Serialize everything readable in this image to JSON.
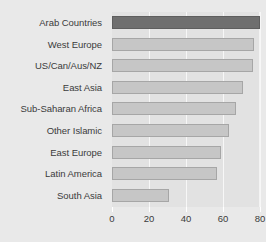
{
  "chart_data": {
    "type": "bar",
    "orientation": "horizontal",
    "title": "",
    "xlabel": "",
    "ylabel": "",
    "xlim": [
      0,
      80
    ],
    "xticks": [
      0,
      20,
      40,
      60,
      80
    ],
    "grid": true,
    "legend": "none",
    "categories": [
      "Arab Countries",
      "West Europe",
      "US/Can/Aus/NZ",
      "East Asia",
      "Sub-Saharan Africa",
      "Other Islamic",
      "East Europe",
      "Latin America",
      "South Asia"
    ],
    "values": [
      80,
      77,
      76,
      71,
      67,
      63,
      59,
      57,
      31
    ],
    "highlight_index": 0,
    "colors": {
      "bar": "#c6c6c6",
      "bar_edge": "#a6a6a6",
      "highlight_bar": "#6f6f6f",
      "highlight_edge": "#5e5e5e",
      "plot_background": "#e2e2e2",
      "page_background": "#e9e9e9",
      "gridline": "#f7f7f7",
      "text": "#3b3b3b"
    }
  }
}
